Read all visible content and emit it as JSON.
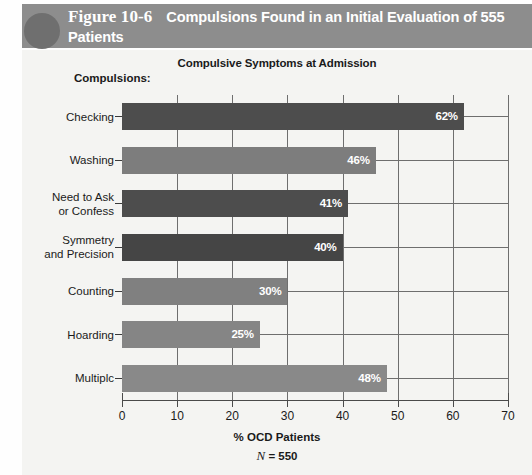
{
  "header": {
    "figure_number": "Figure 10-6",
    "title": "Compulsions Found in an Initial Evaluation of 555 Patients",
    "band_color": "#8d8d8d",
    "circle_color": "#6f6f6f",
    "text_color": "#ffffff"
  },
  "chart_panel": {
    "background_color": "#f4f4f2",
    "category_axis_label": "Compulsions:"
  },
  "chart_data": {
    "type": "bar",
    "orientation": "horizontal",
    "title": "Compulsive Symptoms at Admission",
    "xlabel": "% OCD Patients",
    "ylabel": "Compulsions:",
    "annotation_n": "N = 550",
    "annotation_n_symbol": "N",
    "annotation_n_rest": " = 550",
    "xlim": [
      0,
      70
    ],
    "xticks": [
      0,
      10,
      20,
      30,
      40,
      50,
      60,
      70
    ],
    "xtick_labels": [
      "0",
      "10",
      "20",
      "30",
      "40",
      "50",
      "60",
      "70"
    ],
    "grid": "vertical",
    "legend": "none",
    "categories": [
      "Checking",
      "Washing",
      "Need to Ask or Confess",
      "Symmetry and Precision",
      "Counting",
      "Hoarding",
      "Multiplc"
    ],
    "category_label_lines": [
      [
        "Checking"
      ],
      [
        "Washing"
      ],
      [
        "Need to Ask",
        "or Confess"
      ],
      [
        "Symmetry",
        "and Precision"
      ],
      [
        "Counting"
      ],
      [
        "Hoarding"
      ],
      [
        "Multiplc"
      ]
    ],
    "values": [
      62,
      46,
      41,
      40,
      30,
      25,
      48
    ],
    "value_labels": [
      "62%",
      "46%",
      "41%",
      "40%",
      "30%",
      "25%",
      "48%"
    ],
    "bar_colors": [
      "#4d4d4d",
      "#7d7d7d",
      "#4d4d4d",
      "#454545",
      "#808080",
      "#858585",
      "#898989"
    ]
  }
}
